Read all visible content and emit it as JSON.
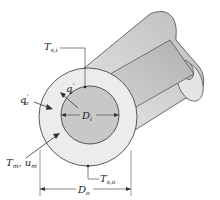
{
  "diagram": {
    "type": "concentric-tube-annulus",
    "colors": {
      "outer_tube": "#d8d8d8",
      "outer_end_face": "#ececec",
      "inner_tube": "#c4c4c4",
      "outline": "#333333"
    },
    "labels": {
      "t_si": {
        "main": "T",
        "sub": "s,i"
      },
      "qi": {
        "main": "q",
        "sup": "″",
        "sub": "i"
      },
      "qo": {
        "main": "q",
        "sup": "″",
        "sub": "o"
      },
      "di": {
        "main": "D",
        "sub": "i"
      },
      "tm_um": {
        "main": "T",
        "sub": "m",
        "main2": ", u",
        "sub2": "m"
      },
      "t_so": {
        "main": "T",
        "sub": "s,o"
      },
      "do": {
        "main": "D",
        "sub": "o"
      }
    }
  }
}
